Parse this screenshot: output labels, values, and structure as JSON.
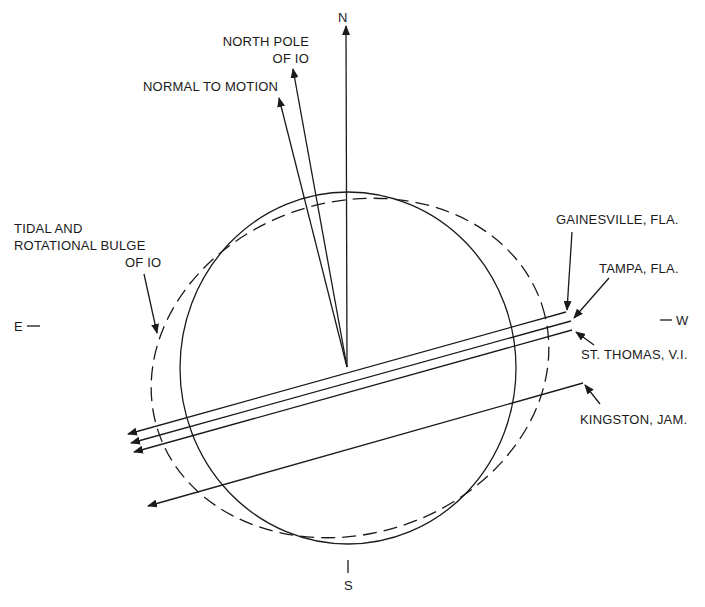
{
  "diagram": {
    "compass": {
      "north": "N",
      "south": "S",
      "east": "E",
      "west": "W"
    },
    "vectors": [
      {
        "id": "north",
        "label": "N"
      },
      {
        "id": "north-pole",
        "label_line1": "NORTH POLE",
        "label_line2": "OF IO"
      },
      {
        "id": "normal",
        "label": "NORMAL TO MOTION"
      }
    ],
    "bulge": {
      "line1": "TIDAL AND",
      "line2": "ROTATIONAL BULGE",
      "line3": "OF IO"
    },
    "tracks": [
      {
        "station": "GAINESVILLE, FLA."
      },
      {
        "station": "TAMPA, FLA."
      },
      {
        "station": "ST. THOMAS, V.I."
      },
      {
        "station": "KINGSTON, JAM."
      }
    ],
    "colors": {
      "ink": "#1a1a1a",
      "background": "#ffffff"
    }
  }
}
